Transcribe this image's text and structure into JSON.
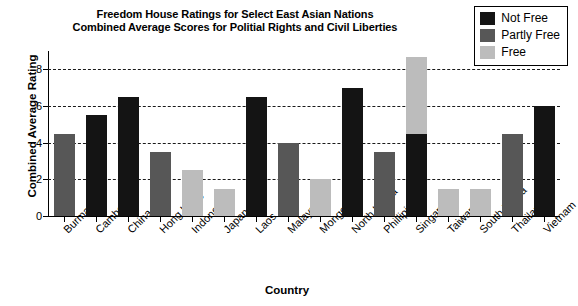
{
  "chart_data": {
    "type": "bar",
    "title": "Freedom House Ratings for Select East Asian Nations\nCombined Average Scores for Politial Rights and Civil Liberties",
    "title_line1": "Freedom House Ratings for Select East Asian Nations",
    "title_line2": "Combined Average Scores for Politial Rights and Civil Liberties",
    "xlabel": "Country",
    "ylabel": "Combined Average Rating",
    "ylim": [
      0,
      9
    ],
    "yticks": [
      0,
      2,
      4,
      6,
      8
    ],
    "grid": true,
    "legend_position": "top-right",
    "categories": [
      "Burma",
      "Cambodia",
      "China",
      "Hong Kong",
      "Indonesia",
      "Japan",
      "Laos",
      "Malaysia",
      "Mongolia",
      "North Korea",
      "Phillipines",
      "Singapore",
      "Taiwan",
      "South Korea",
      "Thailand",
      "Vietnam"
    ],
    "values": [
      4.5,
      5.5,
      6.5,
      3.5,
      2.5,
      1.5,
      6.5,
      4.0,
      2.0,
      7.0,
      3.5,
      4.5,
      1.5,
      1.5,
      4.5,
      6.0
    ],
    "status": [
      "Partly Free",
      "Not Free",
      "Not Free",
      "Partly Free",
      "Free",
      "Free",
      "Not Free",
      "Partly Free",
      "Free",
      "Not Free",
      "Partly Free",
      "Not Free",
      "Free",
      "Free",
      "Partly Free",
      "Not Free"
    ],
    "overlay_bars": [
      {
        "category": "Singapore",
        "value": 8.7,
        "status": "Free"
      }
    ],
    "series": [
      {
        "name": "Not Free",
        "color": "#141414",
        "points": [
          {
            "category": "Cambodia",
            "value": 5.5
          },
          {
            "category": "China",
            "value": 6.5
          },
          {
            "category": "Laos",
            "value": 6.5
          },
          {
            "category": "North Korea",
            "value": 7.0
          },
          {
            "category": "Singapore",
            "value": 4.5
          },
          {
            "category": "Vietnam",
            "value": 6.0
          }
        ]
      },
      {
        "name": "Partly Free",
        "color": "#575757",
        "points": [
          {
            "category": "Burma",
            "value": 4.5
          },
          {
            "category": "Hong Kong",
            "value": 3.5
          },
          {
            "category": "Malaysia",
            "value": 4.0
          },
          {
            "category": "Phillipines",
            "value": 3.5
          },
          {
            "category": "Thailand",
            "value": 4.5
          }
        ]
      },
      {
        "name": "Free",
        "color": "#bcbcbc",
        "points": [
          {
            "category": "Indonesia",
            "value": 2.5
          },
          {
            "category": "Japan",
            "value": 1.5
          },
          {
            "category": "Mongolia",
            "value": 2.0
          },
          {
            "category": "Singapore",
            "value": 8.7
          },
          {
            "category": "Taiwan",
            "value": 1.5
          },
          {
            "category": "South Korea",
            "value": 1.5
          }
        ]
      }
    ]
  },
  "legend": {
    "items": [
      {
        "label": "Not Free",
        "color": "#141414"
      },
      {
        "label": "Partly Free",
        "color": "#575757"
      },
      {
        "label": "Free",
        "color": "#bcbcbc"
      }
    ]
  }
}
